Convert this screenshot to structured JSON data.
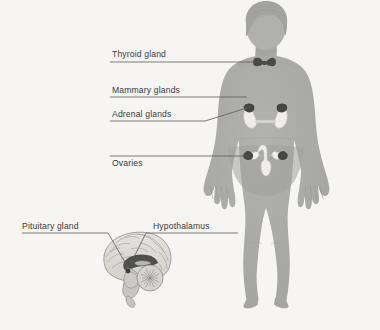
{
  "figure": {
    "background_color": "#f6f5f3",
    "body_color": "#a9a9a6",
    "body_shade_color": "#9d9d9a",
    "organ_light_color": "#efeeeb",
    "organ_dark_color": "#4a4a48",
    "brain_color": "#dedcd8",
    "brain_outline_color": "#8a8a86",
    "leader_color": "#5c5c5a",
    "text_color": "#3a3a38"
  },
  "labels": [
    {
      "id": "thyroid",
      "text": "Thyroid gland",
      "x": 112,
      "y": 57,
      "anchor": "start"
    },
    {
      "id": "mammary",
      "text": "Mammary glands",
      "x": 112,
      "y": 93,
      "anchor": "start"
    },
    {
      "id": "adrenal",
      "text": "Adrenal glands",
      "x": 112,
      "y": 117,
      "anchor": "start"
    },
    {
      "id": "ovaries",
      "text": "Ovaries",
      "x": 112,
      "y": 166,
      "anchor": "start"
    },
    {
      "id": "pituitary",
      "text": "Pituitary gland",
      "x": 22,
      "y": 229,
      "anchor": "start"
    },
    {
      "id": "hypothalamus",
      "text": "Hypothalamus",
      "x": 153,
      "y": 229,
      "anchor": "start"
    }
  ],
  "leaders": [
    {
      "id": "thyroid",
      "points": "110,62 255,62"
    },
    {
      "id": "mammary",
      "points": "110,97 247,97"
    },
    {
      "id": "adrenal",
      "points": "110,121 205,121 250,107"
    },
    {
      "id": "ovaries",
      "points": "110,156 249,156"
    },
    {
      "id": "pituitary",
      "points": "22,233 108,233 129,269"
    },
    {
      "id": "hypothalamus",
      "points": "238,233 146,233 131,263"
    }
  ],
  "organs": [
    {
      "id": "thyroid-gland",
      "label": "Thyroid gland",
      "tone": "dark"
    },
    {
      "id": "kidney-left",
      "label": "Kidney",
      "tone": "light"
    },
    {
      "id": "kidney-right",
      "label": "Kidney",
      "tone": "light"
    },
    {
      "id": "adrenal-left",
      "label": "Adrenal gland",
      "tone": "dark"
    },
    {
      "id": "adrenal-right",
      "label": "Adrenal gland",
      "tone": "dark"
    },
    {
      "id": "uterus",
      "label": "Uterus",
      "tone": "light"
    },
    {
      "id": "ovary-left",
      "label": "Ovary",
      "tone": "dark"
    },
    {
      "id": "ovary-right",
      "label": "Ovary",
      "tone": "dark"
    },
    {
      "id": "hypothalamus",
      "label": "Hypothalamus",
      "tone": "dark"
    },
    {
      "id": "pituitary-gland",
      "label": "Pituitary gland",
      "tone": "dark"
    }
  ]
}
